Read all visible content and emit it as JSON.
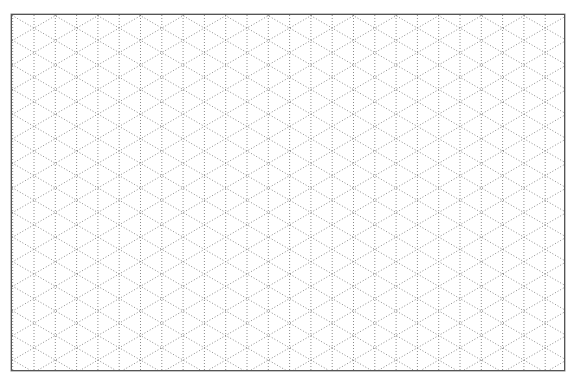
{
  "sheet": {
    "type": "isometric-dot-grid-paper",
    "frame": {
      "x": 11,
      "y": 14,
      "width": 554,
      "height": 357,
      "border_color": "#555555"
    },
    "grid": {
      "vertical_spacing_px": 21.3,
      "diagonal_angles_deg": [
        30,
        -30
      ],
      "line_style": "dotted",
      "line_color": "#8a8a8a",
      "background_color": "#ffffff"
    }
  }
}
